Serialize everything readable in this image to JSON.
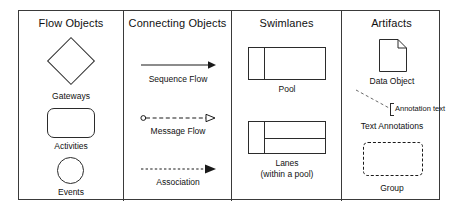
{
  "diagram": {
    "accent_color": "#000000",
    "line_color": "#2b2b2b",
    "background": "#ffffff",
    "columns": [
      {
        "id": "flow-objects",
        "title": "Flow Objects",
        "items": [
          {
            "id": "gateways",
            "label": "Gateways",
            "shape": "diamond-icon"
          },
          {
            "id": "activities",
            "label": "Activities",
            "shape": "rounded-rectangle-icon"
          },
          {
            "id": "events",
            "label": "Events",
            "shape": "circle-icon"
          }
        ]
      },
      {
        "id": "connecting-objects",
        "title": "Connecting Objects",
        "items": [
          {
            "id": "sequence-flow",
            "label": "Sequence Flow",
            "shape": "solid-arrow-icon"
          },
          {
            "id": "message-flow",
            "label": "Message Flow",
            "shape": "dashed-open-arrow-icon"
          },
          {
            "id": "association",
            "label": "Association",
            "shape": "dotted-arrow-icon"
          }
        ]
      },
      {
        "id": "swimlanes",
        "title": "Swimlanes",
        "items": [
          {
            "id": "pool",
            "label": "Pool",
            "label2": "",
            "shape": "pool-icon"
          },
          {
            "id": "lanes",
            "label": "Lanes",
            "label2": "(within a pool)",
            "shape": "lanes-icon"
          }
        ]
      },
      {
        "id": "artifacts",
        "title": "Artifacts",
        "items": [
          {
            "id": "data-object",
            "label": "Data Object",
            "shape": "document-icon"
          },
          {
            "id": "text-annotations",
            "label": "Text Annotations",
            "annotation_text": "Annotation text",
            "shape": "annotation-bracket-icon"
          },
          {
            "id": "group",
            "label": "Group",
            "shape": "dashed-rounded-rectangle-icon"
          }
        ]
      }
    ]
  }
}
